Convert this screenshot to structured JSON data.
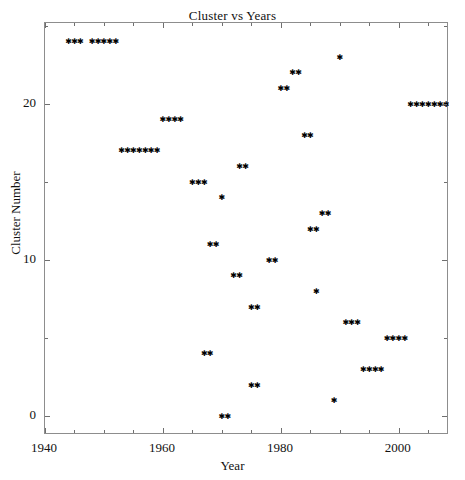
{
  "chart_data": {
    "type": "scatter",
    "title": "Cluster vs Years",
    "xlabel": "Year",
    "ylabel": "Cluster Number",
    "xlim": [
      1940,
      2008.5
    ],
    "ylim": [
      -1.2,
      25.2
    ],
    "xticks": [
      1940,
      1960,
      1980,
      2000
    ],
    "yticks": [
      0,
      10,
      20
    ],
    "xtick_labels": [
      "1940",
      "1960",
      "1980",
      "2000"
    ],
    "ytick_labels": [
      "0",
      "10",
      "20"
    ],
    "x_minor_step": 5,
    "y_minor_step": 5,
    "grid": false,
    "legend": null,
    "marker": "asterisk",
    "marker_color": "#000000",
    "frame_color": "#8d8d8d",
    "background": "#ffffff",
    "series": [
      {
        "name": "clusters",
        "points": [
          {
            "x": 1944,
            "y": 24
          },
          {
            "x": 1945,
            "y": 24
          },
          {
            "x": 1946,
            "y": 24
          },
          {
            "x": 1948,
            "y": 24
          },
          {
            "x": 1949,
            "y": 24
          },
          {
            "x": 1950,
            "y": 24
          },
          {
            "x": 1951,
            "y": 24
          },
          {
            "x": 1952,
            "y": 24
          },
          {
            "x": 1990,
            "y": 23
          },
          {
            "x": 1982,
            "y": 22
          },
          {
            "x": 1983,
            "y": 22
          },
          {
            "x": 1980,
            "y": 21
          },
          {
            "x": 1981,
            "y": 21
          },
          {
            "x": 2002,
            "y": 20
          },
          {
            "x": 2003,
            "y": 20
          },
          {
            "x": 2004,
            "y": 20
          },
          {
            "x": 2005,
            "y": 20
          },
          {
            "x": 2006,
            "y": 20
          },
          {
            "x": 2007,
            "y": 20
          },
          {
            "x": 2008,
            "y": 20
          },
          {
            "x": 1960,
            "y": 19
          },
          {
            "x": 1961,
            "y": 19
          },
          {
            "x": 1962,
            "y": 19
          },
          {
            "x": 1963,
            "y": 19
          },
          {
            "x": 1984,
            "y": 18
          },
          {
            "x": 1985,
            "y": 18
          },
          {
            "x": 1953,
            "y": 17
          },
          {
            "x": 1954,
            "y": 17
          },
          {
            "x": 1955,
            "y": 17
          },
          {
            "x": 1956,
            "y": 17
          },
          {
            "x": 1957,
            "y": 17
          },
          {
            "x": 1958,
            "y": 17
          },
          {
            "x": 1959,
            "y": 17
          },
          {
            "x": 1973,
            "y": 16
          },
          {
            "x": 1974,
            "y": 16
          },
          {
            "x": 1965,
            "y": 15
          },
          {
            "x": 1966,
            "y": 15
          },
          {
            "x": 1967,
            "y": 15
          },
          {
            "x": 1970,
            "y": 14
          },
          {
            "x": 1987,
            "y": 13
          },
          {
            "x": 1988,
            "y": 13
          },
          {
            "x": 1985,
            "y": 12
          },
          {
            "x": 1986,
            "y": 12
          },
          {
            "x": 1968,
            "y": 11
          },
          {
            "x": 1969,
            "y": 11
          },
          {
            "x": 1978,
            "y": 10
          },
          {
            "x": 1979,
            "y": 10
          },
          {
            "x": 1972,
            "y": 9
          },
          {
            "x": 1973,
            "y": 9
          },
          {
            "x": 1986,
            "y": 8
          },
          {
            "x": 1975,
            "y": 7
          },
          {
            "x": 1976,
            "y": 7
          },
          {
            "x": 1991,
            "y": 6
          },
          {
            "x": 1992,
            "y": 6
          },
          {
            "x": 1993,
            "y": 6
          },
          {
            "x": 1998,
            "y": 5
          },
          {
            "x": 1999,
            "y": 5
          },
          {
            "x": 2000,
            "y": 5
          },
          {
            "x": 2001,
            "y": 5
          },
          {
            "x": 1967,
            "y": 4
          },
          {
            "x": 1968,
            "y": 4
          },
          {
            "x": 1994,
            "y": 3
          },
          {
            "x": 1995,
            "y": 3
          },
          {
            "x": 1996,
            "y": 3
          },
          {
            "x": 1997,
            "y": 3
          },
          {
            "x": 1975,
            "y": 2
          },
          {
            "x": 1976,
            "y": 2
          },
          {
            "x": 1989,
            "y": 1
          },
          {
            "x": 1970,
            "y": 0
          },
          {
            "x": 1971,
            "y": 0
          }
        ]
      }
    ]
  }
}
